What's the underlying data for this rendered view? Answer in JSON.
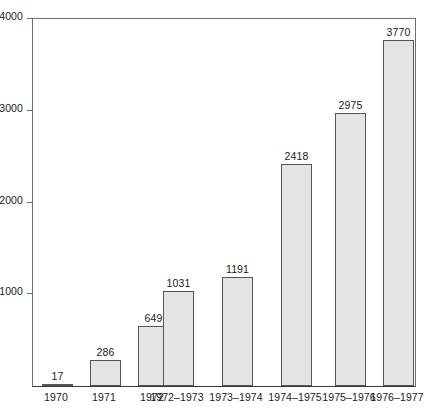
{
  "chart_data": {
    "type": "bar",
    "title": "",
    "subtitle": "",
    "xlabel": "",
    "ylabel": "",
    "categories": [
      "1970",
      "1971",
      "1972",
      "1972–1973",
      "1973–1974",
      "1974–1975",
      "1975–1976",
      "1976–1977"
    ],
    "values": [
      17,
      286,
      649,
      1031,
      1191,
      2418,
      2975,
      3770
    ],
    "data_labels": [
      "17",
      "286",
      "649",
      "1031",
      "1191",
      "2418",
      "2975",
      "3770"
    ],
    "ylim": [
      0,
      4000
    ],
    "y_ticks": [
      1000,
      2000,
      3000,
      4000
    ],
    "y_tick_labels": [
      "1000",
      "2000",
      "3000",
      "4000"
    ],
    "x_ticks_visible": false,
    "grid": false,
    "legend": null,
    "annotations": [],
    "colors": {
      "bar_fill": "#e4e4e4",
      "bar_border": "#565656",
      "axis": "#6e6e6e",
      "baseline": "#3a3a3a",
      "text": "#1a1a1a",
      "background": "#ffffff"
    }
  }
}
